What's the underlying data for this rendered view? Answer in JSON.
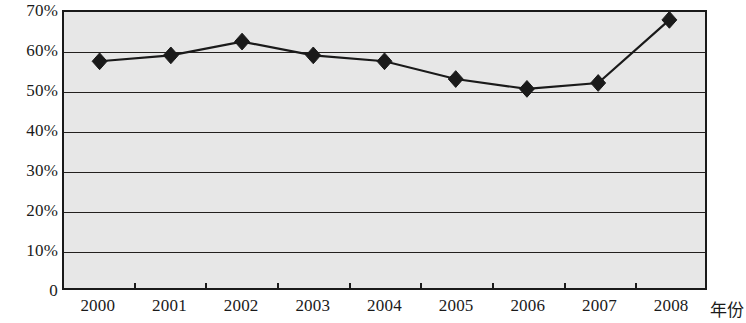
{
  "chart_data": {
    "type": "line",
    "title": "",
    "subtitle": "",
    "xlabel": "年份",
    "ylabel": "",
    "categories": [
      "2000",
      "2001",
      "2002",
      "2003",
      "2004",
      "2005",
      "2006",
      "2007",
      "2008"
    ],
    "values": [
      57.5,
      59,
      62.5,
      59,
      57.5,
      53,
      50.5,
      52,
      68
    ],
    "ytick_labels": [
      "70%",
      "60%",
      "50%",
      "40%",
      "30%",
      "20%",
      "10%",
      "0"
    ],
    "ytick_values": [
      70,
      60,
      50,
      40,
      30,
      20,
      10,
      0
    ],
    "ylim": [
      0,
      70
    ],
    "grid": true,
    "legend": "none",
    "series": [
      {
        "name": "",
        "values": [
          57.5,
          59,
          62.5,
          59,
          57.5,
          53,
          50.5,
          52,
          68
        ],
        "marker": "diamond",
        "color": "#1a1a1a"
      }
    ],
    "plot_background": "#e7e7e7",
    "line_color": "#1a1a1a",
    "axis_color": "#1a1a1a"
  }
}
